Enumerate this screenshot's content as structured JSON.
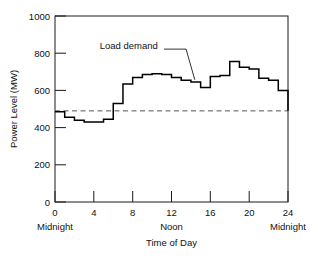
{
  "chart_data": {
    "type": "line",
    "title": "",
    "subtitle": "",
    "xlabel": "Time of Day",
    "ylabel": "Power Level (MW)",
    "xlim": [
      0,
      24
    ],
    "ylim": [
      0,
      1000
    ],
    "grid": false,
    "legend_position": "none",
    "step_style": "post",
    "x_ticks": [
      0,
      4,
      8,
      12,
      16,
      20,
      24
    ],
    "x_tick_labels": [
      "0",
      "4",
      "8",
      "12",
      "16",
      "20",
      "24"
    ],
    "y_ticks": [
      0,
      200,
      400,
      600,
      800,
      1000
    ],
    "y_tick_labels": [
      "0",
      "200",
      "400",
      "600",
      "800",
      "1000"
    ],
    "x_secondary_labels": [
      {
        "x": 0,
        "text": "Midnight"
      },
      {
        "x": 12,
        "text": "Noon"
      },
      {
        "x": 24,
        "text": "Midnight"
      }
    ],
    "series": [
      {
        "name": "Load demand",
        "units": "MW",
        "x": [
          0,
          1,
          2,
          3,
          4,
          5,
          6,
          7,
          8,
          9,
          10,
          11,
          12,
          13,
          14,
          15,
          16,
          17,
          18,
          19,
          20,
          21,
          22,
          23,
          24
        ],
        "values": [
          485,
          455,
          440,
          430,
          430,
          445,
          530,
          635,
          670,
          685,
          690,
          685,
          670,
          655,
          645,
          615,
          675,
          680,
          755,
          725,
          715,
          665,
          655,
          600,
          490
        ]
      }
    ],
    "reference_lines": [
      {
        "name": "average-level",
        "orientation": "horizontal",
        "value": 490,
        "style": "dashed",
        "label": ""
      }
    ],
    "annotations": [
      {
        "name": "load-demand-callout",
        "text": "Load demand",
        "text_x": 4.6,
        "text_y": 840,
        "leader_from_x": 13.5,
        "leader_from_y": 822,
        "leader_to_x": 14.4,
        "leader_to_y": 657
      }
    ],
    "colors": {
      "series": "#000000",
      "reference": "#555555",
      "axis": "#1a1a1a",
      "background": "#ffffff",
      "text": "#111111"
    }
  }
}
